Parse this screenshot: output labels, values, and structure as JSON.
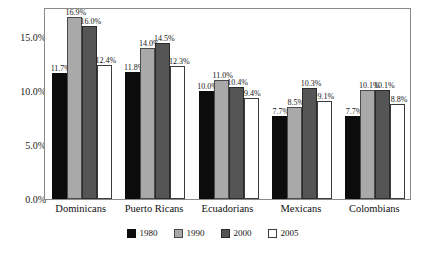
{
  "chart_data": {
    "type": "bar",
    "title": "",
    "subtitle": "",
    "xlabel": "",
    "ylabel": "",
    "ylim": [
      0,
      17.8
    ],
    "grid": false,
    "legend_position": "bottom",
    "value_label_format": "percent-1dp",
    "categories": [
      "Dominicans",
      "Puerto Ricans",
      "Ecuadorians",
      "Mexicans",
      "Colombians"
    ],
    "ytick_labels": [
      "0.0%",
      "5.0%",
      "10.0%",
      "15.0%"
    ],
    "ytick_values": [
      0,
      5,
      10,
      15
    ],
    "series": [
      {
        "name": "1980",
        "color": "#0c0c0c",
        "values": [
          11.7,
          11.8,
          10.0,
          7.7,
          7.7
        ],
        "labels": [
          "11.7%",
          "11.8%",
          "10.0%",
          "7.7%",
          "7.7%"
        ]
      },
      {
        "name": "1990",
        "color": "#a9a9a9",
        "values": [
          16.9,
          14.0,
          11.0,
          8.5,
          10.1
        ],
        "labels": [
          "16.9%",
          "14.0%",
          "11.0%",
          "8.5%",
          "10.1%"
        ]
      },
      {
        "name": "2000",
        "color": "#555555",
        "values": [
          16.0,
          14.5,
          10.4,
          10.3,
          10.1
        ],
        "labels": [
          "16.0%",
          "14.5%",
          "10.4%",
          "10.3%",
          "10.1%"
        ]
      },
      {
        "name": "2005",
        "color": "#ffffff",
        "values": [
          12.4,
          12.3,
          9.4,
          9.1,
          8.8
        ],
        "labels": [
          "12.4%",
          "12.3%",
          "9.4%",
          "9.1%",
          "8.8%"
        ]
      }
    ]
  },
  "legend": {
    "items": [
      {
        "label": "1980",
        "swatch": "c1980"
      },
      {
        "label": "1990",
        "swatch": "c1990"
      },
      {
        "label": "2000",
        "swatch": "c2000"
      },
      {
        "label": "2005",
        "swatch": "c2005"
      }
    ]
  }
}
